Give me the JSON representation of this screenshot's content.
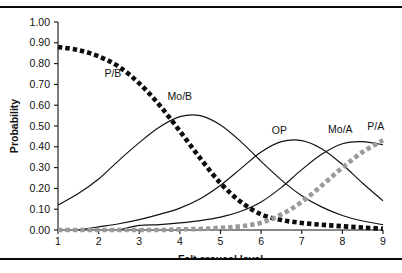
{
  "figure": {
    "has_top_rule": true,
    "has_bottom_rule": true,
    "background": "#ffffff",
    "rule_color": "#0a0a0a"
  },
  "chart_data": {
    "type": "line",
    "title": "",
    "xlabel": "Felt arousal level",
    "ylabel": "Probability",
    "xlim": [
      1,
      9
    ],
    "ylim": [
      0.0,
      1.0
    ],
    "grid": false,
    "legend": "inline-labels",
    "xticks": [
      "1",
      "2",
      "3",
      "4",
      "5",
      "6",
      "7",
      "8",
      "9"
    ],
    "xtick_values": [
      1,
      2,
      3,
      4,
      5,
      6,
      7,
      8,
      9
    ],
    "yticks": [
      "0.00",
      "0.10",
      "0.20",
      "0.30",
      "0.40",
      "0.50",
      "0.60",
      "0.70",
      "0.80",
      "0.90",
      "1.00"
    ],
    "ytick_values": [
      0.0,
      0.1,
      0.2,
      0.3,
      0.4,
      0.5,
      0.6,
      0.7,
      0.8,
      0.9,
      1.0
    ],
    "x": [
      1,
      1.5,
      2,
      2.5,
      3,
      3.5,
      4,
      4.5,
      5,
      5.5,
      6,
      6.5,
      7,
      7.5,
      8,
      8.5,
      9
    ],
    "series": [
      {
        "name": "P/B",
        "style": "dotted",
        "color": "#0d0d0d",
        "label": "P/B",
        "label_x": 2.35,
        "label_y": 0.735,
        "values": [
          0.88,
          0.865,
          0.835,
          0.785,
          0.705,
          0.6,
          0.475,
          0.345,
          0.225,
          0.135,
          0.075,
          0.048,
          0.034,
          0.025,
          0.018,
          0.012,
          0.006
        ]
      },
      {
        "name": "Mo/B",
        "style": "solid",
        "color": "#111111",
        "label": "Mo/B",
        "label_x": 4.0,
        "label_y": 0.625,
        "values": [
          0.12,
          0.175,
          0.245,
          0.335,
          0.42,
          0.495,
          0.545,
          0.55,
          0.505,
          0.425,
          0.33,
          0.24,
          0.165,
          0.11,
          0.07,
          0.043,
          0.026
        ]
      },
      {
        "name": "OP",
        "style": "solid",
        "color": "#111111",
        "label": "OP",
        "label_x": 6.45,
        "label_y": 0.46,
        "values": [
          0.0,
          0.0,
          0.015,
          0.03,
          0.05,
          0.075,
          0.105,
          0.15,
          0.215,
          0.295,
          0.375,
          0.425,
          0.43,
          0.39,
          0.315,
          0.225,
          0.14
        ]
      },
      {
        "name": "Mo/A",
        "style": "solid",
        "color": "#111111",
        "label": "Mo/A",
        "label_x": 7.95,
        "label_y": 0.465,
        "values": [
          0.0,
          0.0,
          0.0,
          0.0,
          0.022,
          0.026,
          0.034,
          0.045,
          0.062,
          0.09,
          0.135,
          0.205,
          0.29,
          0.365,
          0.415,
          0.425,
          0.41
        ]
      },
      {
        "name": "P/A",
        "style": "dotted",
        "color": "#9a9a9a",
        "label": "P/A",
        "label_x": 8.82,
        "label_y": 0.48,
        "values": [
          0.0,
          0.0,
          0.0,
          0.0,
          0.0,
          0.0,
          0.003,
          0.005,
          0.01,
          0.018,
          0.035,
          0.075,
          0.135,
          0.215,
          0.3,
          0.375,
          0.432
        ]
      }
    ]
  }
}
